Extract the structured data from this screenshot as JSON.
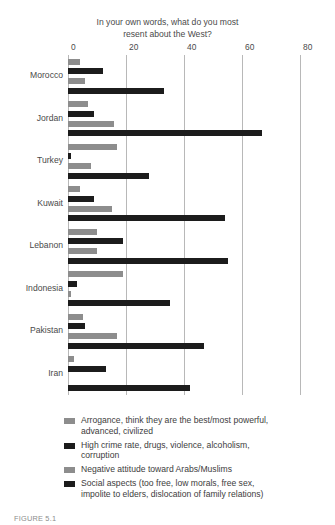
{
  "chart_data": {
    "type": "bar",
    "orientation": "horizontal",
    "title": "In your own words, what do you most resent about the West?",
    "title_lines": [
      "In your own words, what do you most",
      "resent about the West?"
    ],
    "xlabel": "",
    "ylabel": "",
    "xlim": [
      0,
      80
    ],
    "xticks": [
      0,
      20,
      40,
      60,
      80
    ],
    "grid": true,
    "legend_position": "bottom",
    "categories": [
      "Morocco",
      "Jordan",
      "Turkey",
      "Kuwait",
      "Lebanon",
      "Indonesia",
      "Pakistan",
      "Iran"
    ],
    "series": [
      {
        "name": "Arrogance, think they are the best/most powerful, advanced, civilized",
        "color": "#8d8d8d",
        "values": [
          4,
          7,
          17,
          4,
          10,
          19,
          5,
          2
        ]
      },
      {
        "name": "High crime rate, drugs, violence, alcoholism, corruption",
        "color": "#1c1c1c",
        "values": [
          12,
          9,
          1,
          9,
          19,
          3,
          6,
          13
        ]
      },
      {
        "name": "Negative attitude toward Arabs/Muslims",
        "color": "#8d8d8d",
        "values": [
          6,
          16,
          8,
          15,
          10,
          1,
          17,
          0
        ]
      },
      {
        "name": "Social aspects (too free, low morals, free sex, impolite to elders, dislocation of family relations)",
        "color": "#1c1c1c",
        "values": [
          33,
          67,
          28,
          54,
          55,
          35,
          47,
          42
        ]
      }
    ]
  },
  "legend": {
    "items": [
      {
        "swatch": "#8d8d8d",
        "lines": [
          "Arrogance, think they are the best/most powerful,",
          "advanced, civilized"
        ]
      },
      {
        "swatch": "#1c1c1c",
        "lines": [
          "High crime rate, drugs, violence, alcoholism,",
          "corruption"
        ]
      },
      {
        "swatch": "#8d8d8d",
        "lines": [
          "Negative attitude toward Arabs/Muslims"
        ]
      },
      {
        "swatch": "#1c1c1c",
        "lines": [
          "Social aspects (too free, low morals, free sex,",
          "impolite to elders, dislocation of family relations)"
        ]
      }
    ]
  },
  "caption": "FIGURE 5.1"
}
